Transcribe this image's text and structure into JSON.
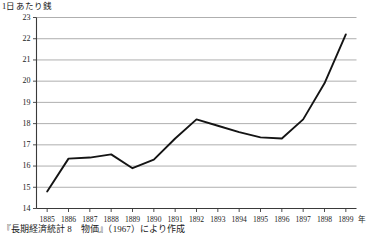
{
  "chart_data": {
    "type": "line",
    "title": "",
    "ylabel": "1日あたり銭",
    "xlabel": "年",
    "ylim": [
      14,
      23
    ],
    "yticks": [
      14,
      15,
      16,
      17,
      18,
      19,
      20,
      21,
      22,
      23
    ],
    "grid": true,
    "legend": null,
    "categories": [
      "1885",
      "1886",
      "1887",
      "1888",
      "1889",
      "1890",
      "1891",
      "1892",
      "1893",
      "1894",
      "1895",
      "1896",
      "1897",
      "1898",
      "1899"
    ],
    "values": [
      14.8,
      16.35,
      16.4,
      16.55,
      15.9,
      16.3,
      17.3,
      18.2,
      17.9,
      17.6,
      17.35,
      17.3,
      18.2,
      19.9,
      22.2
    ],
    "series": [
      {
        "name": "1日あたり銭",
        "color": "#141414",
        "values": [
          14.8,
          16.35,
          16.4,
          16.55,
          15.9,
          16.3,
          17.3,
          18.2,
          17.9,
          17.6,
          17.35,
          17.3,
          18.2,
          19.9,
          22.2
        ]
      }
    ]
  },
  "caption": {
    "text": "『長期経済統計 8　物価』（1967）により作成"
  }
}
